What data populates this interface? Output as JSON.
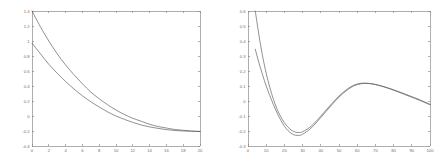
{
  "figure": {
    "background_color": "#ffffff",
    "axis_color": "#8c8c8c",
    "tick_label_color": "#6e6e6e",
    "curve_color": "#555555",
    "panel_count": 2
  },
  "chart_data": [
    {
      "id": "left-plot",
      "type": "line",
      "title": "",
      "subtitle": "",
      "xlabel": "",
      "ylabel": "",
      "grid": false,
      "legend": null,
      "xlim": [
        0,
        20
      ],
      "ylim": [
        -0.4,
        1.4
      ],
      "xticks": [
        0,
        2,
        4,
        6,
        8,
        10,
        12,
        14,
        16,
        18,
        20
      ],
      "xticklabels": [
        "0",
        "2",
        "4",
        "6",
        "8",
        "10",
        "12",
        "14",
        "16",
        "18",
        "20"
      ],
      "yticks": [
        -0.4,
        -0.2,
        0,
        0.2,
        0.4,
        0.6,
        0.8,
        1,
        1.2,
        1.4
      ],
      "yticklabels": [
        "-0.4",
        "-0.2",
        "0",
        "0.2",
        "0.4",
        "0.6",
        "0.8",
        "1",
        "1.2",
        "1.4"
      ],
      "x": [
        0,
        1,
        2,
        3,
        4,
        5,
        6,
        7,
        8,
        9,
        10,
        11,
        12,
        13,
        14,
        15,
        16,
        17,
        18,
        19,
        20
      ],
      "series": [
        {
          "name": "upper-curve",
          "values": [
            1.4,
            1.19,
            1.0,
            0.83,
            0.68,
            0.55,
            0.43,
            0.32,
            0.23,
            0.15,
            0.08,
            0.02,
            -0.03,
            -0.07,
            -0.11,
            -0.14,
            -0.16,
            -0.18,
            -0.19,
            -0.2,
            -0.205
          ]
        },
        {
          "name": "lower-curve",
          "values": [
            0.97,
            0.83,
            0.69,
            0.57,
            0.46,
            0.36,
            0.27,
            0.19,
            0.12,
            0.055,
            0.0,
            -0.045,
            -0.085,
            -0.12,
            -0.145,
            -0.165,
            -0.182,
            -0.193,
            -0.2,
            -0.204,
            -0.207
          ]
        }
      ]
    },
    {
      "id": "right-plot",
      "type": "line",
      "title": "",
      "subtitle": "",
      "xlabel": "",
      "ylabel": "",
      "grid": false,
      "legend": null,
      "xlim": [
        0,
        100
      ],
      "ylim": [
        -0.3,
        0.6
      ],
      "xticks": [
        0,
        10,
        20,
        30,
        40,
        50,
        60,
        70,
        80,
        90,
        100
      ],
      "xticklabels": [
        "0",
        "10",
        "20",
        "30",
        "40",
        "50",
        "60",
        "70",
        "80",
        "90",
        "100"
      ],
      "yticks": [
        -0.3,
        -0.2,
        -0.1,
        0,
        0.1,
        0.2,
        0.3,
        0.4,
        0.5,
        0.6
      ],
      "yticklabels": [
        "-0.3",
        "-0.2",
        "-0.1",
        "0",
        "0.1",
        "0.2",
        "0.3",
        "0.4",
        "0.5",
        "0.6"
      ],
      "x": [
        4,
        6,
        8,
        10,
        12,
        14,
        16,
        18,
        20,
        22,
        24,
        26,
        28,
        30,
        34,
        38,
        42,
        46,
        50,
        54,
        58,
        62,
        66,
        70,
        74,
        78,
        82,
        86,
        90,
        94,
        100
      ],
      "series": [
        {
          "name": "upper-curve",
          "values": [
            0.6,
            0.44,
            0.3,
            0.185,
            0.09,
            0.01,
            -0.055,
            -0.105,
            -0.145,
            -0.175,
            -0.196,
            -0.207,
            -0.21,
            -0.205,
            -0.175,
            -0.128,
            -0.073,
            -0.018,
            0.033,
            0.075,
            0.105,
            0.118,
            0.118,
            0.11,
            0.097,
            0.081,
            0.063,
            0.044,
            0.025,
            0.006,
            -0.025
          ]
        },
        {
          "name": "lower-curve",
          "values": [
            0.345,
            0.255,
            0.175,
            0.1,
            0.035,
            -0.025,
            -0.08,
            -0.128,
            -0.168,
            -0.198,
            -0.218,
            -0.228,
            -0.229,
            -0.222,
            -0.188,
            -0.138,
            -0.082,
            -0.026,
            0.026,
            0.068,
            0.1,
            0.115,
            0.117,
            0.11,
            0.098,
            0.083,
            0.066,
            0.048,
            0.029,
            0.01,
            -0.022
          ]
        }
      ]
    }
  ]
}
